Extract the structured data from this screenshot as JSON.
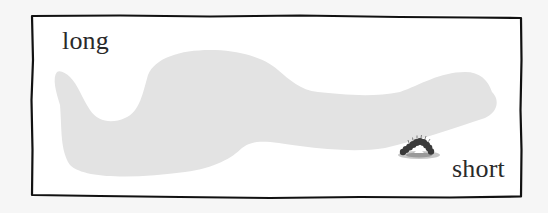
{
  "labels": {
    "start": "long",
    "end": "short"
  },
  "colors": {
    "background": "#f6f6f6",
    "frame_fill": "#ffffff",
    "frame_border": "#111111",
    "path_fill": "#e3e3e3",
    "text": "#2a2a2a",
    "caterpillar": "#3a3a3a"
  },
  "icons": {
    "caterpillar": "caterpillar-icon"
  }
}
